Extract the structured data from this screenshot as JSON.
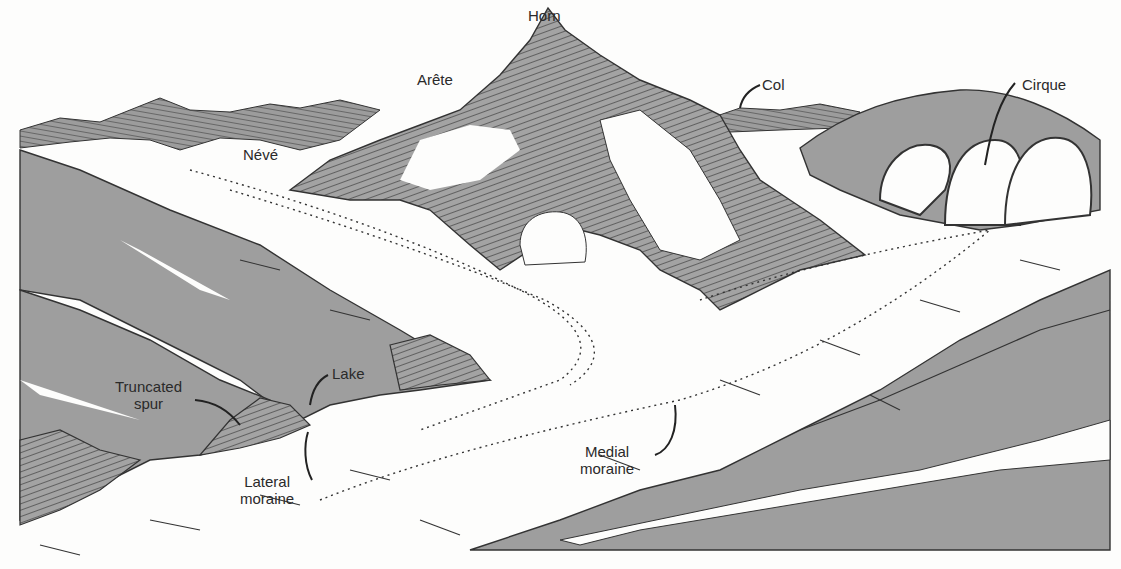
{
  "diagram": {
    "colors": {
      "rock": "#9a9a9a",
      "rock_dark": "#808080",
      "ice": "#fdfdfc",
      "ink": "#2a2a2a"
    },
    "labels": {
      "horn": "Horn",
      "arete": "Arête",
      "col": "Col",
      "cirque": "Cirque",
      "neve": "Névé",
      "truncated_spur_line1": "Truncated",
      "truncated_spur_line2": "spur",
      "lake": "Lake",
      "lateral_moraine_line1": "Lateral",
      "lateral_moraine_line2": "moraine",
      "medial_moraine_line1": "Medial",
      "medial_moraine_line2": "moraine"
    }
  }
}
